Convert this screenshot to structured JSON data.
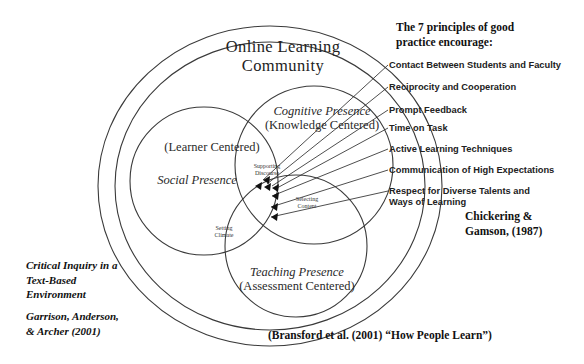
{
  "diagram": {
    "outer_circle_label": "Online Learning\nCommunity",
    "colors": {
      "stroke": "#3a3a3a",
      "text": "#1a1a1a",
      "background": "#ffffff"
    },
    "venn": {
      "social": {
        "title": "Social Presence",
        "subtitle": "(Learner Centered)"
      },
      "cognitive": {
        "title": "Cognitive Presence",
        "subtitle": "(Knowledge Centered)"
      },
      "teaching": {
        "title": "Teaching Presence",
        "subtitle": "(Assessment Centered)"
      },
      "intersections": {
        "supporting_discourse": "Supporting\nDiscourse",
        "selecting_content": "Selecting\nContent",
        "setting_climate": "Setting\nClimate"
      }
    }
  },
  "principles": {
    "heading": "The 7 principles of good\npractice encourage:",
    "items": [
      {
        "id": 1,
        "label": "Contact Between Students and Faculty"
      },
      {
        "id": 2,
        "label": "Reciprocity and Cooperation"
      },
      {
        "id": 3,
        "label": "Prompt Feedback"
      },
      {
        "id": 4,
        "label": "Time on Task"
      },
      {
        "id": 5,
        "label": "Active Learning Techniques"
      },
      {
        "id": 6,
        "label": "Communication of High Expectations"
      },
      {
        "id": 7,
        "label": "Respect for Diverse Talents and\nWays of Learning"
      }
    ],
    "attribution": "Chickering &\nGamson, (1987)"
  },
  "citations": {
    "left_title": "Critical Inquiry in a\nText-Based\nEnvironment",
    "left_source": "Garrison, Anderson,\n& Archer (2001)",
    "bottom": "(Bransford et al. (2001) “How People Learn”)"
  }
}
